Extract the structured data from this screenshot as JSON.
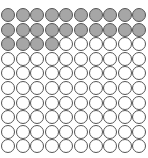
{
  "chart_data": {
    "type": "waffle",
    "title": "",
    "rows": 10,
    "cols": 10,
    "total": 100,
    "filled": 24,
    "colors": {
      "filled": "#a6a6a6",
      "empty": "#ffffff",
      "stroke": "#555555"
    }
  }
}
